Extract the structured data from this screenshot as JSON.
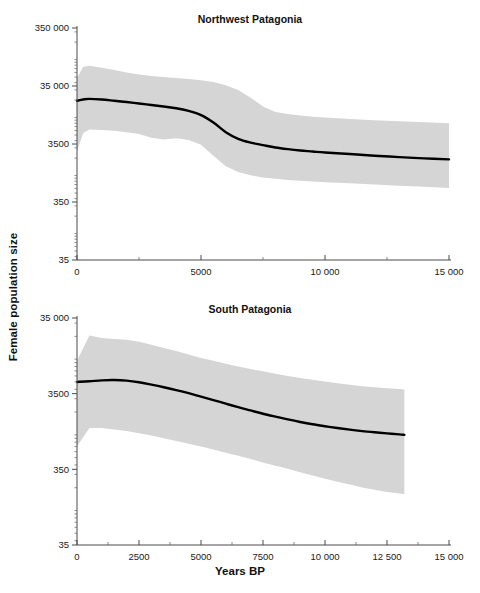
{
  "figure": {
    "ylabel": "Female population size",
    "xlabel": "Years BP"
  },
  "chart_data": [
    {
      "type": "line",
      "title": "Northwest Patagonia",
      "xlabel": "Years BP",
      "ylabel": "Female population size",
      "yscale": "log",
      "ylim": [
        35,
        350000
      ],
      "xlim": [
        0,
        15000
      ],
      "ytick_labels": [
        "350 000",
        "35 000",
        "3500",
        "350",
        "35"
      ],
      "ytick_values": [
        350000,
        35000,
        3500,
        350,
        35
      ],
      "xtick_labels": [
        "0",
        "5000",
        "10 000",
        "15 000"
      ],
      "xtick_values": [
        0,
        5000,
        10000,
        15000
      ],
      "xminor_values": [
        2500,
        7500,
        12500
      ],
      "grid": false,
      "legend": "none",
      "series": [
        {
          "name": "Median female effective population size",
          "color": "#000000",
          "x": [
            0,
            250,
            500,
            1000,
            1500,
            2000,
            2500,
            3000,
            3500,
            4000,
            4500,
            5000,
            5500,
            6000,
            6500,
            7000,
            7500,
            8000,
            8500,
            9000,
            9500,
            10000,
            11000,
            12000,
            13000,
            14000,
            15000
          ],
          "values": [
            19500,
            20500,
            21000,
            20500,
            19500,
            18500,
            17500,
            16500,
            15500,
            14500,
            13000,
            11000,
            8200,
            5600,
            4300,
            3700,
            3350,
            3050,
            2850,
            2700,
            2600,
            2500,
            2350,
            2200,
            2080,
            1980,
            1900
          ]
        }
      ],
      "band": {
        "name": "95% highest posterior density interval",
        "color": "#d5d5d5",
        "x": [
          0,
          250,
          500,
          1000,
          1500,
          2000,
          2500,
          3000,
          3500,
          4000,
          4500,
          5000,
          5500,
          6000,
          6500,
          7000,
          7500,
          8000,
          8500,
          9000,
          9500,
          10000,
          11000,
          12000,
          13000,
          14000,
          15000
        ],
        "upper": [
          48000,
          75000,
          78000,
          72000,
          66000,
          60000,
          55000,
          52000,
          50000,
          48000,
          46000,
          44000,
          41000,
          36000,
          30000,
          22000,
          15500,
          12500,
          11500,
          10800,
          10300,
          10000,
          9400,
          9000,
          8600,
          8300,
          8000
        ],
        "lower": [
          2600,
          5400,
          6200,
          6100,
          5900,
          5600,
          5200,
          4500,
          4200,
          4400,
          4100,
          3400,
          2200,
          1450,
          1150,
          1010,
          930,
          880,
          840,
          810,
          790,
          770,
          735,
          700,
          670,
          640,
          610
        ]
      }
    },
    {
      "type": "line",
      "title": "South Patagonia",
      "xlabel": "Years BP",
      "ylabel": "Female population size",
      "yscale": "log",
      "ylim": [
        35,
        35000
      ],
      "xlim": [
        0,
        15000
      ],
      "ytick_labels": [
        "35 000",
        "3500",
        "350",
        "35"
      ],
      "ytick_values": [
        35000,
        3500,
        350,
        35
      ],
      "xtick_labels": [
        "0",
        "2500",
        "5000",
        "7500",
        "10 000",
        "12 500",
        "15 000"
      ],
      "xtick_values": [
        0,
        2500,
        5000,
        7500,
        10000,
        12500,
        15000
      ],
      "xminor_values": [
        1250,
        3750,
        6250,
        8750,
        11250,
        13750
      ],
      "grid": false,
      "legend": "none",
      "series": [
        {
          "name": "Median female effective population size",
          "color": "#000000",
          "x": [
            0,
            500,
            1000,
            1500,
            2000,
            2500,
            3000,
            3500,
            4000,
            4500,
            5000,
            5500,
            6000,
            6500,
            7000,
            7500,
            8000,
            8500,
            9000,
            9500,
            10000,
            10500,
            11000,
            11500,
            12000,
            12500,
            13000,
            13200
          ],
          "values": [
            5000,
            5100,
            5250,
            5300,
            5200,
            4950,
            4600,
            4250,
            3900,
            3550,
            3200,
            2880,
            2580,
            2320,
            2100,
            1900,
            1740,
            1600,
            1480,
            1380,
            1300,
            1230,
            1170,
            1120,
            1080,
            1045,
            1015,
            1000
          ]
        }
      ],
      "band": {
        "name": "95% highest posterior density interval",
        "color": "#d5d5d5",
        "x": [
          0,
          500,
          1000,
          1500,
          2000,
          2500,
          3000,
          3500,
          4000,
          4500,
          5000,
          5500,
          6000,
          6500,
          7000,
          7500,
          8000,
          8500,
          9000,
          9500,
          10000,
          10500,
          11000,
          11500,
          12000,
          12500,
          13000,
          13200
        ],
        "upper": [
          9500,
          20500,
          19000,
          18500,
          18000,
          17000,
          15500,
          14000,
          12800,
          11500,
          10400,
          9500,
          8700,
          8000,
          7400,
          6900,
          6400,
          6000,
          5650,
          5350,
          5050,
          4800,
          4600,
          4400,
          4250,
          4120,
          4020,
          3980
        ],
        "lower": [
          700,
          1230,
          1230,
          1180,
          1120,
          1050,
          980,
          900,
          830,
          760,
          700,
          640,
          580,
          530,
          480,
          430,
          390,
          355,
          320,
          290,
          262,
          240,
          220,
          202,
          188,
          176,
          168,
          164
        ]
      }
    }
  ]
}
